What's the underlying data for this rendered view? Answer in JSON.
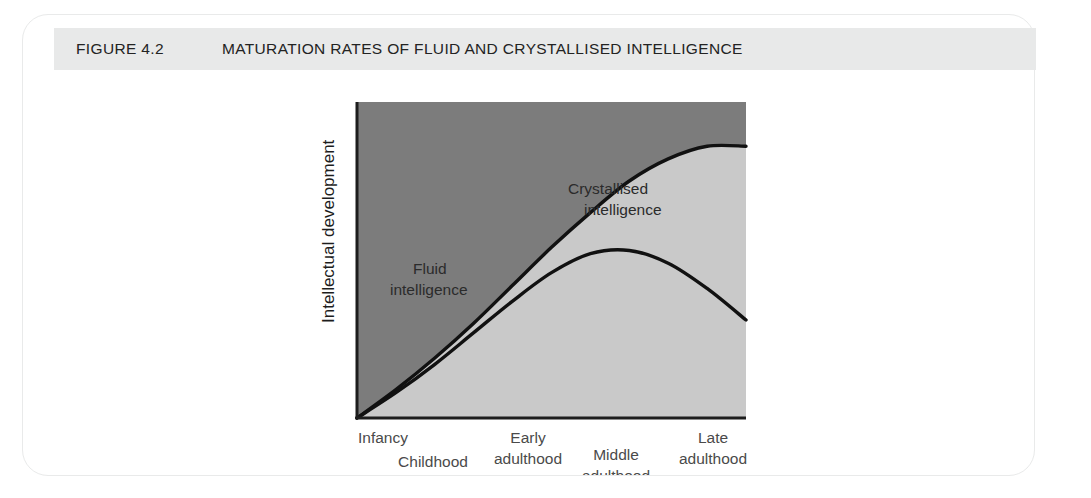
{
  "figure": {
    "number": "FIGURE 4.2",
    "title": "MATURATION RATES OF FLUID AND CRYSTALLISED INTELLIGENCE"
  },
  "colors": {
    "header_bar": "#e8e9e9",
    "card_border": "#e9eaea",
    "upper_region": "#7c7c7c",
    "lower_region": "#c9c9c9",
    "curve_stroke": "#111111",
    "axis": "#1d1d1d",
    "page_background": "#ffffff"
  },
  "chart_data": {
    "type": "line",
    "title": "MATURATION RATES OF FLUID AND CRYSTALLISED INTELLIGENCE",
    "xlabel": "",
    "ylabel": "Intellectual development",
    "grid": false,
    "legend_position": "inline-annotations",
    "xlim": [
      0,
      100
    ],
    "ylim": [
      0,
      100
    ],
    "x_tick_labels": [
      {
        "line1": "Infancy",
        "line2": "",
        "x_percent": 3,
        "row": "upper"
      },
      {
        "line1": "Childhood",
        "line2": "",
        "x_percent": 17,
        "row": "lower"
      },
      {
        "line1": "Early",
        "line2": "adulthood",
        "x_percent": 42,
        "row": "upper"
      },
      {
        "line1": "Middle",
        "line2": "adulthood",
        "x_percent": 64,
        "row": "lower"
      },
      {
        "line1": "Late",
        "line2": "adulthood",
        "x_percent": 91,
        "row": "upper"
      }
    ],
    "series": [
      {
        "name": "Crystallised intelligence",
        "label_line1": "Crystallised",
        "label_line2": "intelligence",
        "x": [
          0,
          10,
          20,
          30,
          40,
          50,
          60,
          70,
          80,
          90,
          100
        ],
        "values": [
          0,
          9,
          19,
          30,
          42,
          54,
          65,
          75,
          82,
          86,
          86
        ]
      },
      {
        "name": "Fluid intelligence",
        "label_line1": "Fluid",
        "label_line2": "intelligence",
        "x": [
          0,
          10,
          20,
          30,
          40,
          50,
          60,
          70,
          80,
          90,
          100
        ],
        "values": [
          0,
          8,
          17,
          27,
          37,
          46,
          52,
          53,
          49,
          41,
          31
        ]
      }
    ],
    "annotations": [
      {
        "text": "Crystallised intelligence",
        "region": "between-curves"
      },
      {
        "text": "Fluid intelligence",
        "region": "below-fluid-curve"
      }
    ]
  }
}
